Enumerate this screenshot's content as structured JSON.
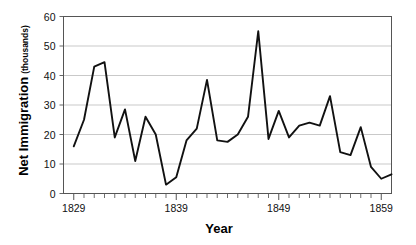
{
  "chart_data": {
    "type": "line",
    "title": "",
    "xlabel": "Year",
    "ylabel": "Net Immigration",
    "ylabel_sub": "(thousands)",
    "ylabel_full": "Net Immigration (thousands)",
    "xlim": [
      1828,
      1860
    ],
    "ylim": [
      0,
      60
    ],
    "yticks": [
      0,
      10,
      20,
      30,
      40,
      50,
      60
    ],
    "ytick_labels": [
      "0",
      "10",
      "20",
      "30",
      "40",
      "50",
      "60"
    ],
    "xtick_labels": [
      "1829",
      "1839",
      "1849",
      "1859"
    ],
    "xtick_values": [
      1829,
      1839,
      1849,
      1859
    ],
    "x_minor_tick_interval": 1,
    "grid": "horizontal",
    "legend": "none",
    "line_color": "#000000",
    "grid_color": "#bbbbbb",
    "axis_color": "#555555",
    "x": [
      1829,
      1830,
      1831,
      1832,
      1833,
      1834,
      1835,
      1836,
      1837,
      1838,
      1839,
      1840,
      1841,
      1842,
      1843,
      1844,
      1845,
      1846,
      1847,
      1848,
      1849,
      1850,
      1851,
      1852,
      1853,
      1854,
      1855,
      1856,
      1857,
      1858,
      1859,
      1860
    ],
    "values": [
      16,
      25,
      43,
      44.5,
      19,
      28.5,
      11,
      26,
      20,
      3,
      5.5,
      18,
      22,
      38.5,
      18,
      17.5,
      20,
      26,
      55,
      18.5,
      28,
      19,
      23,
      24,
      23,
      33,
      14,
      13,
      22.5,
      9,
      5,
      6.5
    ],
    "series": [
      {
        "name": "Net Immigration",
        "values": [
          16,
          25,
          43,
          44.5,
          19,
          28.5,
          11,
          26,
          20,
          3,
          5.5,
          18,
          22,
          38.5,
          18,
          17.5,
          20,
          26,
          55,
          18.5,
          28,
          19,
          23,
          24,
          23,
          33,
          14,
          13,
          22.5,
          9,
          5,
          6.5
        ]
      }
    ]
  }
}
